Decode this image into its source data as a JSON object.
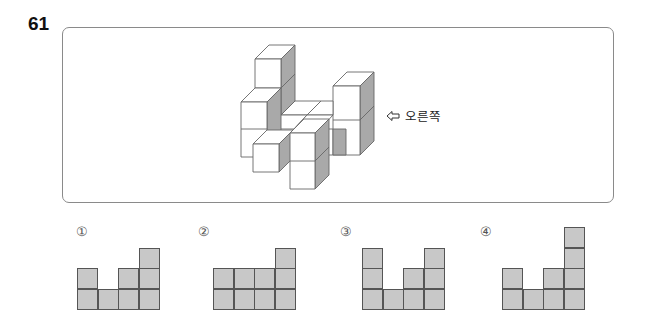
{
  "question": {
    "number": "61",
    "direction_label": "오른쪽",
    "direction_icon": "left-arrow-outline-icon"
  },
  "options": [
    {
      "label": "①",
      "column_heights": [
        2,
        1,
        2,
        3
      ]
    },
    {
      "label": "②",
      "column_heights": [
        2,
        2,
        2,
        3
      ]
    },
    {
      "label": "③",
      "column_heights": [
        3,
        1,
        2,
        3
      ]
    },
    {
      "label": "④",
      "column_heights": [
        2,
        1,
        2,
        4
      ]
    }
  ],
  "colors": {
    "cube_face": "#ffffff",
    "cube_shade": "#a9a9a9",
    "cell_fill": "#c8c8c8",
    "cell_border": "#555555",
    "box_border": "#8a8a8a"
  }
}
